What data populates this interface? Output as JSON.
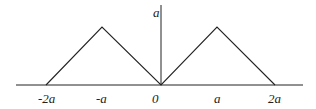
{
  "diagram": {
    "type": "piecewise-linear-graph",
    "y_axis_label": "a",
    "x_tick_labels": [
      "-2a",
      "-a",
      "0",
      "a",
      "2a"
    ],
    "points": [
      {
        "x": "-2a",
        "y": 0
      },
      {
        "x": "-a",
        "y": "a"
      },
      {
        "x": "0",
        "y": 0
      },
      {
        "x": "a",
        "y": "a"
      },
      {
        "x": "2a",
        "y": 0
      }
    ],
    "line_color": "#222222"
  }
}
